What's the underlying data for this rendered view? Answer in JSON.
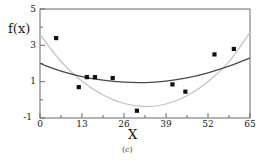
{
  "figure": {
    "caption": "(c)",
    "xlabel": "X",
    "ylabel": "f(x)"
  },
  "axes": {
    "x_ticks": [
      "0",
      "13",
      "26",
      "39",
      "52",
      "65"
    ],
    "y_ticks": [
      "5",
      "3",
      "1",
      "-1"
    ]
  },
  "colors": {
    "frame": "#6b6b6b",
    "marker": "#111111",
    "curve_dark": "#4a4a4a",
    "curve_light": "#c2c2c2",
    "background": "#ffffff"
  },
  "chart_data": {
    "type": "scatter",
    "title": "",
    "subtitle": "",
    "caption": "(c)",
    "xlabel": "X",
    "ylabel": "f(x)",
    "xlim": [
      0,
      65
    ],
    "ylim": [
      -1,
      5
    ],
    "xticks": [
      0,
      13,
      26,
      39,
      52,
      65
    ],
    "yticks": [
      -1,
      1,
      3,
      5
    ],
    "grid": false,
    "legend": "none",
    "series": [
      {
        "name": "observed data",
        "type": "scatter",
        "marker": "square",
        "color": "#111111",
        "x": [
          5,
          12,
          14.5,
          17,
          22.5,
          30,
          41,
          45,
          54,
          60
        ],
        "y": [
          3.4,
          0.7,
          1.25,
          1.25,
          1.2,
          -0.6,
          0.85,
          0.45,
          2.5,
          2.8
        ]
      },
      {
        "name": "fitted curve (dark, shallow quadratic)",
        "type": "line",
        "color": "#4a4a4a",
        "x": [
          0,
          6.5,
          13,
          19.5,
          26,
          32.5,
          39,
          45.5,
          52,
          58.5,
          65
        ],
        "y": [
          2.0,
          1.58,
          1.28,
          1.08,
          0.97,
          0.95,
          1.03,
          1.21,
          1.49,
          1.85,
          2.3
        ]
      },
      {
        "name": "fitted curve (light, steep quadratic)",
        "type": "line",
        "color": "#c2c2c2",
        "x": [
          0,
          6.5,
          13,
          19.5,
          26,
          32.5,
          39,
          45.5,
          52,
          58.5,
          65
        ],
        "y": [
          3.6,
          2.11,
          1.02,
          0.27,
          -0.2,
          -0.37,
          -0.23,
          0.23,
          1.0,
          2.1,
          3.72
        ]
      }
    ]
  }
}
